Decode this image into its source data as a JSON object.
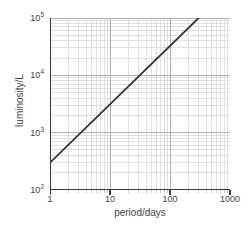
{
  "chart_data": {
    "type": "line",
    "title": "",
    "subtitle": "",
    "xlabel": "period/days",
    "ylabel": "luminosity/L",
    "xscale": "log",
    "yscale": "log",
    "xlim": [
      1,
      1000
    ],
    "ylim": [
      100,
      100000
    ],
    "grid": true,
    "grid_minor": true,
    "legend": null,
    "xticks": [
      1,
      10,
      100,
      1000
    ],
    "xtick_labels": [
      "1",
      "10",
      "100",
      "1000"
    ],
    "yticks": [
      100,
      1000,
      10000,
      100000
    ],
    "ytick_labels": [
      "10",
      "10",
      "10",
      "10"
    ],
    "ytick_exponents": [
      "2",
      "3",
      "4",
      "5"
    ],
    "series": [
      {
        "name": "period-luminosity relation",
        "color": "#333333",
        "x": [
          1,
          300
        ],
        "y": [
          300,
          100000
        ]
      }
    ],
    "annotations": []
  },
  "style": {
    "axis_color": "#3a3a3a",
    "grid_major_color": "#b0b0b0",
    "grid_minor_color": "#d4d4d4",
    "line_color": "#333333",
    "background": "#ffffff"
  },
  "axis_labels": {
    "x": "period/days",
    "y": "luminosity/L"
  },
  "x_tick_text": {
    "t0": "1",
    "t1": "10",
    "t2": "100",
    "t3": "1000"
  },
  "y_tick_text": {
    "base": "10",
    "e0": "2",
    "e1": "3",
    "e2": "4",
    "e3": "5"
  }
}
